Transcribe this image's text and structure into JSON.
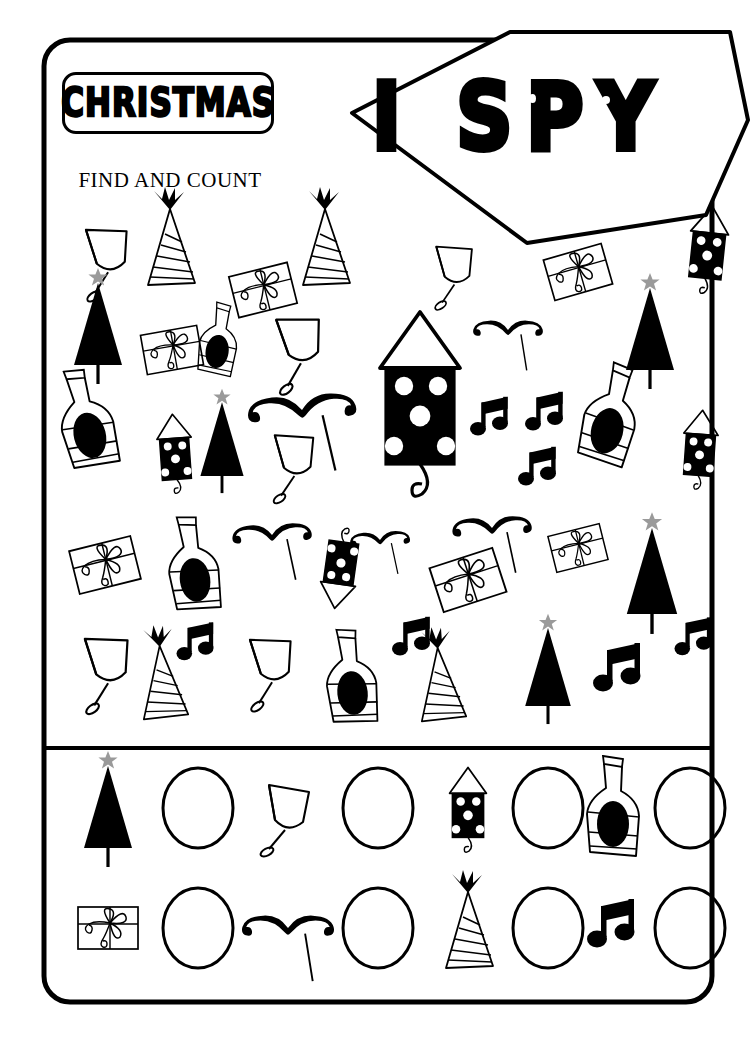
{
  "page": {
    "title": "CHRISTMAS",
    "subtitle": "FIND AND COUNT",
    "banner_title": "I SPY",
    "worksheet_type": "i-spy find and count",
    "ink_color": "#000000",
    "paper_color": "#ffffff",
    "star_color": "#9a9a9a"
  },
  "puzzle": {
    "label": "puzzle-field",
    "item_types": [
      "christmas-tree",
      "wine-glass",
      "party-hat",
      "gift-box",
      "champagne-bottle",
      "firework-rocket",
      "mustache",
      "music-note"
    ],
    "items": [
      {
        "type": "wine-glass",
        "x": 108,
        "y": 250,
        "s": 1.0,
        "r": -8
      },
      {
        "type": "party-hat",
        "x": 170,
        "y": 245,
        "s": 1.0,
        "r": 0
      },
      {
        "type": "party-hat",
        "x": 325,
        "y": 245,
        "s": 1.0,
        "r": 0
      },
      {
        "type": "gift-box",
        "x": 263,
        "y": 290,
        "s": 1.0,
        "r": -14
      },
      {
        "type": "wine-glass",
        "x": 455,
        "y": 265,
        "s": 0.88,
        "r": -6
      },
      {
        "type": "gift-box",
        "x": 578,
        "y": 272,
        "s": 1.0,
        "r": -16
      },
      {
        "type": "firework-rocket",
        "x": 708,
        "y": 248,
        "s": 0.95,
        "r": 6
      },
      {
        "type": "christmas-tree",
        "x": 98,
        "y": 325,
        "s": 1.0,
        "r": 0
      },
      {
        "type": "gift-box",
        "x": 172,
        "y": 350,
        "s": 0.95,
        "r": -10
      },
      {
        "type": "champagne-bottle",
        "x": 218,
        "y": 340,
        "s": 0.72,
        "r": 8
      },
      {
        "type": "wine-glass",
        "x": 300,
        "y": 340,
        "s": 1.05,
        "r": -10
      },
      {
        "type": "mustache",
        "x": 508,
        "y": 330,
        "s": 0.72,
        "r": 0
      },
      {
        "type": "christmas-tree",
        "x": 650,
        "y": 330,
        "s": 1.0,
        "r": 0
      },
      {
        "type": "champagne-bottle",
        "x": 85,
        "y": 420,
        "s": 1.0,
        "r": -14
      },
      {
        "type": "firework-rocket",
        "x": 175,
        "y": 452,
        "s": 0.86,
        "r": -4
      },
      {
        "type": "christmas-tree",
        "x": 222,
        "y": 440,
        "s": 0.9,
        "r": 0
      },
      {
        "type": "mustache",
        "x": 302,
        "y": 410,
        "s": 1.12,
        "r": -4
      },
      {
        "type": "firework-rocket",
        "x": 420,
        "y": 400,
        "s": 2.0,
        "r": 0
      },
      {
        "type": "music-note",
        "x": 490,
        "y": 420,
        "s": 0.8,
        "r": 0
      },
      {
        "type": "music-note",
        "x": 545,
        "y": 415,
        "s": 0.8,
        "r": 0
      },
      {
        "type": "music-note",
        "x": 538,
        "y": 470,
        "s": 0.8,
        "r": 0
      },
      {
        "type": "champagne-bottle",
        "x": 610,
        "y": 415,
        "s": 1.0,
        "r": 14
      },
      {
        "type": "firework-rocket",
        "x": 700,
        "y": 448,
        "s": 0.86,
        "r": 4
      },
      {
        "type": "wine-glass",
        "x": 295,
        "y": 455,
        "s": 0.95,
        "r": -6
      },
      {
        "type": "gift-box",
        "x": 105,
        "y": 565,
        "s": 1.05,
        "r": -14
      },
      {
        "type": "champagne-bottle",
        "x": 192,
        "y": 565,
        "s": 0.95,
        "r": -8
      },
      {
        "type": "mustache",
        "x": 272,
        "y": 535,
        "s": 0.82,
        "r": -3
      },
      {
        "type": "mustache",
        "x": 380,
        "y": 540,
        "s": 0.62,
        "r": -3
      },
      {
        "type": "firework-rocket",
        "x": 340,
        "y": 570,
        "s": 0.88,
        "r": 188
      },
      {
        "type": "mustache",
        "x": 492,
        "y": 528,
        "s": 0.82,
        "r": -3
      },
      {
        "type": "gift-box",
        "x": 468,
        "y": 580,
        "s": 1.1,
        "r": -18
      },
      {
        "type": "gift-box",
        "x": 578,
        "y": 548,
        "s": 0.88,
        "r": -14
      },
      {
        "type": "christmas-tree",
        "x": 652,
        "y": 572,
        "s": 1.05,
        "r": 0
      },
      {
        "type": "wine-glass",
        "x": 108,
        "y": 660,
        "s": 1.05,
        "r": -8
      },
      {
        "type": "party-hat",
        "x": 162,
        "y": 680,
        "s": 0.95,
        "r": -4
      },
      {
        "type": "music-note",
        "x": 196,
        "y": 645,
        "s": 0.78,
        "r": 0
      },
      {
        "type": "wine-glass",
        "x": 272,
        "y": 660,
        "s": 1.0,
        "r": -8
      },
      {
        "type": "champagne-bottle",
        "x": 350,
        "y": 678,
        "s": 0.95,
        "r": -6
      },
      {
        "type": "music-note",
        "x": 412,
        "y": 640,
        "s": 0.8,
        "r": 0
      },
      {
        "type": "party-hat",
        "x": 440,
        "y": 682,
        "s": 0.95,
        "r": -4
      },
      {
        "type": "christmas-tree",
        "x": 548,
        "y": 668,
        "s": 0.95,
        "r": 0
      },
      {
        "type": "music-note",
        "x": 618,
        "y": 672,
        "s": 1.0,
        "r": 0
      },
      {
        "type": "music-note",
        "x": 694,
        "y": 640,
        "s": 0.78,
        "r": 0
      }
    ]
  },
  "answer_key": {
    "label": "answer-key",
    "rows": [
      {
        "cells": [
          {
            "icon": "christmas-tree",
            "count_value": ""
          },
          {
            "icon": "wine-glass",
            "count_value": ""
          },
          {
            "icon": "firework-rocket",
            "count_value": ""
          },
          {
            "icon": "champagne-bottle",
            "count_value": ""
          }
        ]
      },
      {
        "cells": [
          {
            "icon": "gift-box",
            "count_value": ""
          },
          {
            "icon": "mustache",
            "count_value": ""
          },
          {
            "icon": "party-hat",
            "count_value": ""
          },
          {
            "icon": "music-note",
            "count_value": ""
          }
        ]
      }
    ]
  }
}
